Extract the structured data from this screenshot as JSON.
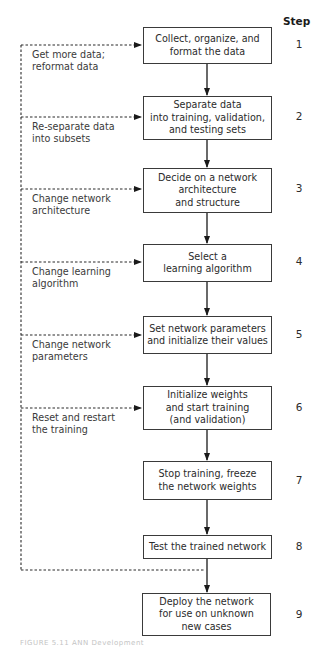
{
  "diagram": {
    "type": "flowchart",
    "step_header": "Step",
    "steps": [
      {
        "number": "1",
        "text": "Collect, organize, and\nformat the data"
      },
      {
        "number": "2",
        "text": "Separate data\ninto training, validation,\nand testing sets"
      },
      {
        "number": "3",
        "text": "Decide on a network\narchitecture\nand structure"
      },
      {
        "number": "4",
        "text": "Select a\nlearning algorithm"
      },
      {
        "number": "5",
        "text": "Set network parameters\nand initialize their values"
      },
      {
        "number": "6",
        "text": "Initialize weights\nand start training\n(and validation)"
      },
      {
        "number": "7",
        "text": "Stop training, freeze\nthe network weights"
      },
      {
        "number": "8",
        "text": "Test the trained network"
      },
      {
        "number": "9",
        "text": "Deploy the network\nfor use on unknown\nnew cases"
      }
    ],
    "feedback_labels": [
      {
        "target_step": "1",
        "text": "Get more data;\nreformat data"
      },
      {
        "target_step": "2",
        "text": "Re-separate data\ninto subsets"
      },
      {
        "target_step": "3",
        "text": "Change network\narchitecture"
      },
      {
        "target_step": "4",
        "text": "Change learning\nalgorithm"
      },
      {
        "target_step": "5",
        "text": "Change network\nparameters"
      },
      {
        "target_step": "6",
        "text": "Reset and restart\nthe training"
      }
    ],
    "caption": "FIGURE 5.11   ANN Development"
  }
}
